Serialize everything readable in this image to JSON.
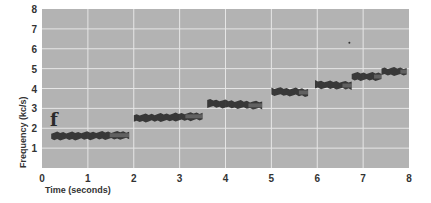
{
  "chart_data": {
    "type": "scatter",
    "subtype": "spectrogram",
    "title": "",
    "panel_label": "f",
    "xlabel": "Time (seconds)",
    "ylabel": "Frequency (kc/s)",
    "xlim": [
      0,
      8
    ],
    "ylim": [
      0,
      8
    ],
    "x_ticks": [
      "0",
      "1",
      "2",
      "3",
      "4",
      "5",
      "6",
      "7",
      "8"
    ],
    "y_ticks": [
      "1",
      "2",
      "3",
      "4",
      "5",
      "6",
      "7",
      "8"
    ],
    "grid": true,
    "legend": null,
    "background_color": "#b3b3b3",
    "grid_color": "#e6e6e6",
    "trace_color": "#2e2e2e",
    "segments": [
      {
        "t_start": 0.2,
        "t_end": 1.9,
        "freq_start": 1.6,
        "freq_end": 1.65
      },
      {
        "t_start": 2.0,
        "t_end": 3.5,
        "freq_start": 2.5,
        "freq_end": 2.6
      },
      {
        "t_start": 3.6,
        "t_end": 4.8,
        "freq_start": 3.25,
        "freq_end": 3.15
      },
      {
        "t_start": 5.0,
        "t_end": 5.8,
        "freq_start": 3.85,
        "freq_end": 3.8
      },
      {
        "t_start": 5.95,
        "t_end": 6.75,
        "freq_start": 4.2,
        "freq_end": 4.15
      },
      {
        "t_start": 6.75,
        "t_end": 7.4,
        "freq_start": 4.6,
        "freq_end": 4.6
      },
      {
        "t_start": 7.4,
        "t_end": 7.95,
        "freq_start": 4.85,
        "freq_end": 4.85
      }
    ],
    "outlier_points": [
      {
        "t": 6.7,
        "freq": 6.3
      }
    ]
  }
}
